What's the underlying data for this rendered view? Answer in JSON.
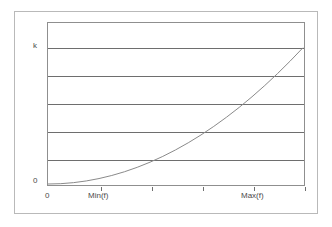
{
  "chart_data": {
    "type": "line",
    "title": "",
    "xlabel": "",
    "ylabel": "",
    "grid": true,
    "legend": false,
    "x": [
      0,
      0.05,
      0.1,
      0.15,
      0.2,
      0.25,
      0.3,
      0.35,
      0.4,
      0.45,
      0.5,
      0.55,
      0.6,
      0.65,
      0.7,
      0.75,
      0.8,
      0.85,
      0.9,
      0.95,
      1.0
    ],
    "y": [
      0,
      0.0025,
      0.01,
      0.0225,
      0.04,
      0.0625,
      0.09,
      0.1225,
      0.16,
      0.2025,
      0.25,
      0.3025,
      0.36,
      0.4225,
      0.49,
      0.5625,
      0.64,
      0.7225,
      0.81,
      0.9025,
      1.0
    ],
    "xlim": [
      0,
      1.2
    ],
    "ylim": [
      0,
      1.2
    ],
    "series": [
      {
        "name": "curve",
        "color": "#8a8a8a",
        "start_label": "0",
        "end_label": "k"
      }
    ],
    "y_tick_labels": [
      "0",
      "k"
    ],
    "y_tick_values": [
      0,
      1.0
    ],
    "x_tick_labels": [
      "0",
      "Min(f)",
      "Max(f)"
    ],
    "x_tick_values": [
      0,
      0.2,
      0.82
    ],
    "gridline_count": 5,
    "gridline_values": [
      0.2,
      0.4,
      0.6,
      0.8,
      1.0
    ]
  },
  "axes": {
    "y": {
      "top_label": "k",
      "origin_label": "0"
    },
    "x": {
      "origin_label": "0",
      "min_label": "Min(f)",
      "max_label": "Max(f)"
    }
  },
  "colors": {
    "outer_frame": "#b9b9b9",
    "plot_border": "#8f8f8f",
    "gridline": "#6e6e6e",
    "curve": "#8a8a8a",
    "text": "#4a4a4a",
    "background": "#ffffff"
  }
}
